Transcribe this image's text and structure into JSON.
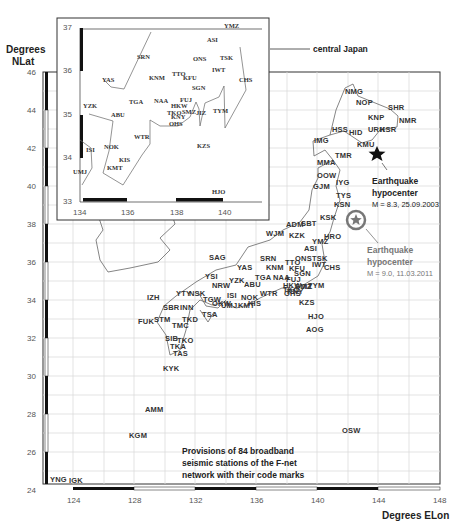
{
  "main_map": {
    "y_axis_title": [
      "Degrees",
      "NLat"
    ],
    "x_axis_title": "Degrees ELon",
    "y_ticks": [
      "46",
      "44",
      "42",
      "40",
      "38",
      "36",
      "34",
      "32",
      "30",
      "28",
      "26",
      "24"
    ],
    "x_ticks": [
      "124",
      "128",
      "132",
      "136",
      "140",
      "144",
      "148"
    ],
    "caption": [
      "Provisions of 84 broadband",
      "seismic stations of the F-net",
      "network with their code marks"
    ],
    "eq_2003": {
      "title": [
        "Earthquake",
        "hypocenter"
      ],
      "detail": "M = 8.3, 25.09.2003"
    },
    "eq_2011": {
      "title": [
        "Earthquake",
        "hypocenter"
      ],
      "detail": "M = 9.0, 11.03.2011"
    },
    "stations": [
      {
        "code": "NMG",
        "x": 345,
        "y": 92
      },
      {
        "code": "NOP",
        "x": 356,
        "y": 103
      },
      {
        "code": "SHR",
        "x": 388,
        "y": 108
      },
      {
        "code": "KNP",
        "x": 368,
        "y": 118
      },
      {
        "code": "NMR",
        "x": 399,
        "y": 121
      },
      {
        "code": "HSS",
        "x": 332,
        "y": 130
      },
      {
        "code": "HID",
        "x": 349,
        "y": 133
      },
      {
        "code": "URH",
        "x": 368,
        "y": 130
      },
      {
        "code": "KSR",
        "x": 380,
        "y": 130
      },
      {
        "code": "IMG",
        "x": 314,
        "y": 141
      },
      {
        "code": "KMU",
        "x": 357,
        "y": 145
      },
      {
        "code": "TMR",
        "x": 335,
        "y": 156
      },
      {
        "code": "MMA",
        "x": 317,
        "y": 163
      },
      {
        "code": "OOW",
        "x": 317,
        "y": 176
      },
      {
        "code": "GJM",
        "x": 313,
        "y": 187
      },
      {
        "code": "IYG",
        "x": 336,
        "y": 183
      },
      {
        "code": "TYS",
        "x": 336,
        "y": 196
      },
      {
        "code": "KSN",
        "x": 334,
        "y": 205
      },
      {
        "code": "KSK",
        "x": 320,
        "y": 218
      },
      {
        "code": "ADM",
        "x": 286,
        "y": 225
      },
      {
        "code": "SBT",
        "x": 301,
        "y": 224
      },
      {
        "code": "WJM",
        "x": 266,
        "y": 234
      },
      {
        "code": "KZK",
        "x": 289,
        "y": 236
      },
      {
        "code": "HRO",
        "x": 324,
        "y": 237
      },
      {
        "code": "YMZ",
        "x": 312,
        "y": 242
      },
      {
        "code": "ASI",
        "x": 304,
        "y": 249
      },
      {
        "code": "ONS",
        "x": 295,
        "y": 259
      },
      {
        "code": "TSK",
        "x": 312,
        "y": 259
      },
      {
        "code": "IWT",
        "x": 312,
        "y": 265
      },
      {
        "code": "CHS",
        "x": 324,
        "y": 268
      },
      {
        "code": "SRN",
        "x": 260,
        "y": 259
      },
      {
        "code": "TTO",
        "x": 285,
        "y": 263
      },
      {
        "code": "KFU",
        "x": 289,
        "y": 269
      },
      {
        "code": "SGN",
        "x": 294,
        "y": 274
      },
      {
        "code": "KNM",
        "x": 266,
        "y": 268
      },
      {
        "code": "YAS",
        "x": 237,
        "y": 268
      },
      {
        "code": "SAG",
        "x": 209,
        "y": 258
      },
      {
        "code": "TGA",
        "x": 255,
        "y": 278
      },
      {
        "code": "NAA",
        "x": 273,
        "y": 278
      },
      {
        "code": "FUJ",
        "x": 286,
        "y": 280
      },
      {
        "code": "HKW",
        "x": 283,
        "y": 286
      },
      {
        "code": "TYM",
        "x": 308,
        "y": 286
      },
      {
        "code": "SMZ",
        "x": 295,
        "y": 287
      },
      {
        "code": "JIZ",
        "x": 301,
        "y": 287
      },
      {
        "code": "TKO",
        "x": 283,
        "y": 290
      },
      {
        "code": "KNY",
        "x": 287,
        "y": 292
      },
      {
        "code": "OHS",
        "x": 284,
        "y": 294
      },
      {
        "code": "YZK",
        "x": 229,
        "y": 281
      },
      {
        "code": "ABU",
        "x": 244,
        "y": 285
      },
      {
        "code": "NRW",
        "x": 212,
        "y": 286
      },
      {
        "code": "YSI",
        "x": 205,
        "y": 277
      },
      {
        "code": "WTR",
        "x": 260,
        "y": 294
      },
      {
        "code": "KZS",
        "x": 299,
        "y": 303
      },
      {
        "code": "NOK",
        "x": 241,
        "y": 298
      },
      {
        "code": "ISI",
        "x": 227,
        "y": 296
      },
      {
        "code": "KIS",
        "x": 248,
        "y": 304
      },
      {
        "code": "KMT",
        "x": 238,
        "y": 306
      },
      {
        "code": "TGW",
        "x": 203,
        "y": 300
      },
      {
        "code": "UMJ",
        "x": 221,
        "y": 306
      },
      {
        "code": "OKW",
        "x": 212,
        "y": 304
      },
      {
        "code": "NSK",
        "x": 189,
        "y": 294
      },
      {
        "code": "YTY",
        "x": 176,
        "y": 294
      },
      {
        "code": "IZH",
        "x": 147,
        "y": 298
      },
      {
        "code": "SBR",
        "x": 163,
        "y": 308
      },
      {
        "code": "INN",
        "x": 180,
        "y": 308
      },
      {
        "code": "TSA",
        "x": 202,
        "y": 315
      },
      {
        "code": "FUK",
        "x": 138,
        "y": 322
      },
      {
        "code": "STM",
        "x": 154,
        "y": 320
      },
      {
        "code": "TKD",
        "x": 182,
        "y": 320
      },
      {
        "code": "TMC",
        "x": 172,
        "y": 326
      },
      {
        "code": "SIB",
        "x": 165,
        "y": 339
      },
      {
        "code": "TKO",
        "x": 177,
        "y": 341
      },
      {
        "code": "TKA",
        "x": 170,
        "y": 347
      },
      {
        "code": "TAS",
        "x": 173,
        "y": 354
      },
      {
        "code": "KYK",
        "x": 163,
        "y": 369
      },
      {
        "code": "HJO",
        "x": 308,
        "y": 317
      },
      {
        "code": "AOG",
        "x": 306,
        "y": 330
      },
      {
        "code": "AMM",
        "x": 145,
        "y": 410
      },
      {
        "code": "KGM",
        "x": 129,
        "y": 436
      },
      {
        "code": "OSW",
        "x": 342,
        "y": 431
      },
      {
        "code": "YNG",
        "x": 50,
        "y": 480
      },
      {
        "code": "IGK",
        "x": 69,
        "y": 481
      }
    ]
  },
  "inset_map": {
    "label": "central Japan",
    "y_ticks": [
      "37",
      "36",
      "35",
      "34",
      "33"
    ],
    "x_ticks": [
      "134",
      "136",
      "138",
      "140"
    ],
    "stations": [
      {
        "code": "YMZ",
        "x": 224,
        "y": 27
      },
      {
        "code": "ASI",
        "x": 207,
        "y": 41
      },
      {
        "code": "SRN",
        "x": 137,
        "y": 58
      },
      {
        "code": "ONS",
        "x": 193,
        "y": 60
      },
      {
        "code": "TSK",
        "x": 220,
        "y": 59
      },
      {
        "code": "IWT",
        "x": 212,
        "y": 71
      },
      {
        "code": "YAS",
        "x": 102,
        "y": 81
      },
      {
        "code": "KNM",
        "x": 149,
        "y": 79
      },
      {
        "code": "TTO",
        "x": 172,
        "y": 75
      },
      {
        "code": "KFU",
        "x": 183,
        "y": 79
      },
      {
        "code": "CHS",
        "x": 239,
        "y": 81
      },
      {
        "code": "SGN",
        "x": 192,
        "y": 89
      },
      {
        "code": "YZK",
        "x": 83,
        "y": 107
      },
      {
        "code": "TGA",
        "x": 129,
        "y": 103
      },
      {
        "code": "NAA",
        "x": 154,
        "y": 102
      },
      {
        "code": "FUJ",
        "x": 180,
        "y": 101
      },
      {
        "code": "HKW",
        "x": 171,
        "y": 107
      },
      {
        "code": "SMZ",
        "x": 182,
        "y": 113
      },
      {
        "code": "JIZ",
        "x": 196,
        "y": 114
      },
      {
        "code": "TYM",
        "x": 213,
        "y": 112
      },
      {
        "code": "TKO",
        "x": 167,
        "y": 114
      },
      {
        "code": "KNY",
        "x": 171,
        "y": 118
      },
      {
        "code": "ABU",
        "x": 111,
        "y": 116
      },
      {
        "code": "OHS",
        "x": 169,
        "y": 125
      },
      {
        "code": "WTR",
        "x": 134,
        "y": 138
      },
      {
        "code": "NOK",
        "x": 104,
        "y": 148
      },
      {
        "code": "ISI",
        "x": 86,
        "y": 151
      },
      {
        "code": "KZS",
        "x": 197,
        "y": 147
      },
      {
        "code": "KIS",
        "x": 119,
        "y": 161
      },
      {
        "code": "KMT",
        "x": 107,
        "y": 169
      },
      {
        "code": "UMJ",
        "x": 73,
        "y": 173
      },
      {
        "code": "HJO",
        "x": 212,
        "y": 193
      }
    ]
  },
  "colors": {
    "station_text": "#333333",
    "grid": "#d9d9d9",
    "axis_bar": "#111111",
    "eq_2011_gray": "#777777"
  }
}
